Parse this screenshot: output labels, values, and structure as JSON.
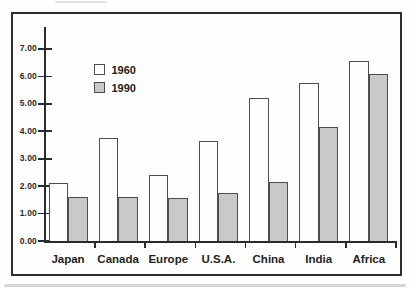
{
  "figure": {
    "background": "#fefefe",
    "ink": "#2b2b2b",
    "frame_border": "#2e2e2e",
    "bar_outline": "#4d4d4d"
  },
  "legend": {
    "position": "upper-left-inside",
    "items": [
      {
        "label": "1960",
        "fill": "#fdfdfd"
      },
      {
        "label": "1990",
        "fill": "#c9c9c9"
      }
    ]
  },
  "chart_data": {
    "type": "bar",
    "title": "",
    "xlabel": "",
    "ylabel": "",
    "grid": false,
    "legend_position": "upper-left-inside",
    "categories": [
      "Japan",
      "Canada",
      "Europe",
      "U.S.A.",
      "China",
      "India",
      "Africa"
    ],
    "series": [
      {
        "name": "1960",
        "fill": "#fdfdfd",
        "values": [
          2.1,
          3.75,
          2.4,
          3.65,
          5.2,
          5.75,
          6.55
        ]
      },
      {
        "name": "1990",
        "fill": "#c9c9c9",
        "values": [
          1.6,
          1.6,
          1.55,
          1.75,
          2.15,
          4.15,
          6.1
        ]
      }
    ],
    "ylim": [
      0,
      7
    ],
    "ytick_interval": 1,
    "ytick_labels": [
      "0.00",
      "1.00",
      "2.00",
      "3.00",
      "4.00",
      "5.00",
      "6.00",
      "7.00"
    ]
  }
}
